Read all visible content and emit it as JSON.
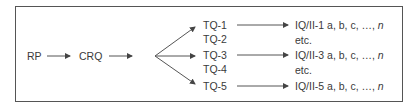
{
  "diagram": {
    "nodes": {
      "rp": "RP",
      "crq": "CRQ",
      "tq1": "TQ-1",
      "tq2": "TQ-2",
      "tq3": "TQ-3",
      "tq4": "TQ-4",
      "tq5": "TQ-5"
    },
    "outputs": {
      "iq1_prefix": "IQ/II-1 a, b, c, …, ",
      "iq3_prefix": "IQ/II-3 a, b, c, …, ",
      "iq5_prefix": "IQ/II-5 a, b, c, …, ",
      "n": "n",
      "etc1": "etc.",
      "etc2": "etc."
    },
    "colors": {
      "line": "#555555",
      "text": "#3a3a3a",
      "border": "#555555"
    },
    "edges": [
      [
        "RP",
        "CRQ"
      ],
      [
        "CRQ",
        "fan"
      ],
      [
        "fan",
        "TQ-1"
      ],
      [
        "fan",
        "TQ-3"
      ],
      [
        "fan",
        "TQ-5"
      ],
      [
        "TQ-1",
        "IQ/II-1"
      ],
      [
        "TQ-3",
        "IQ/II-3"
      ],
      [
        "TQ-5",
        "IQ/II-5"
      ]
    ]
  }
}
